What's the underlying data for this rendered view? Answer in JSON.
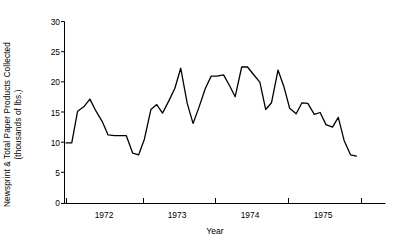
{
  "chart_data": {
    "type": "line",
    "title": "",
    "xlabel": "Year",
    "ylabel": "Newsprint & Total Paper Products Collected (thousands of lbs.)",
    "ylabel_line1": "Newsprint & Total Paper Products Collected",
    "ylabel_line2": "(thousands of lbs.)",
    "ylim": [
      0,
      30
    ],
    "xlim": [
      1971.58,
      1976.0
    ],
    "yticks": [
      0,
      5,
      10,
      15,
      20,
      25,
      30
    ],
    "ytick_labels": [
      "0",
      "5",
      "10",
      "15",
      "20",
      "25",
      "30"
    ],
    "xticks": [
      1971.6,
      1972.6,
      1973.6,
      1974.6,
      1975.6
    ],
    "xtick_labels": [
      "",
      "",
      "",
      "",
      ""
    ],
    "xcategory_labels": [
      "1972",
      "1973",
      "1974",
      "1975"
    ],
    "xcategory_positions": [
      1972.1,
      1973.1,
      1974.1,
      1975.1
    ],
    "grid": false,
    "legend": null,
    "line_color": "#000000",
    "series": [
      {
        "name": "Newsprint & Total Paper Products Collected",
        "x": [
          1971.6,
          1971.68,
          1971.76,
          1971.85,
          1971.93,
          1972.01,
          1972.1,
          1972.18,
          1972.27,
          1972.35,
          1972.43,
          1972.52,
          1972.6,
          1972.68,
          1972.77,
          1972.85,
          1972.93,
          1973.02,
          1973.1,
          1973.18,
          1973.27,
          1973.35,
          1973.43,
          1973.52,
          1973.6,
          1973.68,
          1973.77,
          1973.85,
          1973.93,
          1974.02,
          1974.1,
          1974.18,
          1974.27,
          1974.35,
          1974.43,
          1974.52,
          1974.6,
          1974.68,
          1974.77,
          1974.85,
          1974.93,
          1975.02,
          1975.1,
          1975.18,
          1975.27,
          1975.35,
          1975.43,
          1975.52,
          1975.6
        ],
        "values": [
          10.0,
          10.0,
          15.2,
          16.0,
          17.2,
          15.3,
          13.5,
          11.3,
          11.2,
          11.2,
          11.2,
          8.3,
          8.0,
          10.6,
          15.5,
          16.3,
          14.9,
          17.0,
          19.0,
          22.3,
          16.5,
          13.2,
          15.8,
          19.0,
          21.0,
          21.0,
          21.2,
          19.5,
          17.6,
          22.5,
          22.5,
          21.3,
          20.0,
          15.5,
          16.6,
          22.0,
          19.3,
          15.7,
          14.8,
          16.6,
          16.5,
          14.7,
          15.0,
          13.0,
          12.6,
          14.2,
          10.4,
          8.0,
          7.8
        ]
      }
    ]
  },
  "axes": {
    "x_axis_name": "x-axis",
    "y_axis_name": "y-axis"
  }
}
